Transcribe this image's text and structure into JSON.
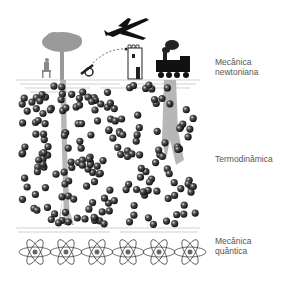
{
  "labels": {
    "newtonian": [
      "Mecânica",
      "newtoniana"
    ],
    "thermodynamics": "Termodinâmica",
    "quantum": [
      "Mecânica",
      "quântica"
    ]
  },
  "illustrations": {
    "top_layer": [
      "person-on-bench",
      "tree",
      "cannon",
      "cannonball-trajectory",
      "tower",
      "airplane",
      "steam-locomotive"
    ],
    "middle_layer": "gas-molecules",
    "bottom_layer": "atoms",
    "atom_count": 6
  },
  "colors": {
    "ink": "#1a1a1a",
    "gray": "#9a9a9a",
    "label": "#555555",
    "line": "#bbbbbb"
  }
}
